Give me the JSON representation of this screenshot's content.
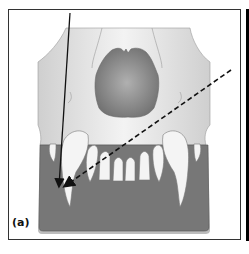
{
  "figure": {
    "panel_label": "(a)",
    "arrows": [
      {
        "name": "solid-arrow",
        "style": "solid",
        "description": "near-vertical beam toward canine root tip"
      },
      {
        "name": "dashed-arrow",
        "style": "dashed",
        "description": "oblique beam toward canine root tip"
      }
    ],
    "colors": {
      "skull": "#dcdcdc",
      "skull_highlight": "#f2f2f2",
      "nasal_cavity": "#8a8a8a",
      "base_plate": "#777777",
      "base_plate_edge": "#bdbdbd",
      "teeth": "#f4f4f4",
      "arrow": "#111111",
      "frame": "#333333"
    }
  }
}
